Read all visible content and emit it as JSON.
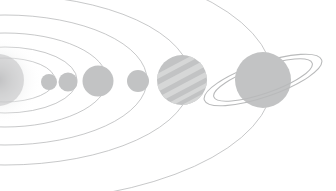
{
  "scene": {
    "title": "Solar System Orbit Diagram",
    "width": 336,
    "height": 191,
    "background_color": "#ffffff",
    "orbit_stroke_color": "#b9babb",
    "orbit_stroke_width": 0.8,
    "planet_fill_color": "#c2c3c4",
    "planet_band_color": "#d6d7d7",
    "ring_stroke_color": "#b9babb",
    "sun_glow_color": "#e9eaea",
    "sun_core_color": "#bfc0c1",
    "focus_x": 5,
    "focus_y": 80
  },
  "sun": {
    "name": "sun",
    "label": "Sun",
    "cx": -2,
    "cy": 80,
    "r": 26,
    "glow_r": 44,
    "clipped": true
  },
  "orbits": [
    {
      "name": "orbit-mercury",
      "label": "Mercury orbit",
      "cx": 5,
      "cy": 80,
      "rx": 50,
      "ry": 22
    },
    {
      "name": "orbit-venus",
      "label": "Venus orbit",
      "cx": 5,
      "cy": 80,
      "rx": 72,
      "ry": 33
    },
    {
      "name": "orbit-earth",
      "label": "Earth orbit",
      "cx": 5,
      "cy": 80,
      "rx": 102,
      "ry": 47
    },
    {
      "name": "orbit-mars",
      "label": "Mars orbit",
      "cx": 5,
      "cy": 80,
      "rx": 142,
      "ry": 65
    },
    {
      "name": "orbit-jupiter",
      "label": "Jupiter orbit",
      "cx": 5,
      "cy": 80,
      "rx": 186,
      "ry": 85
    },
    {
      "name": "orbit-saturn",
      "label": "Saturn orbit",
      "cx": 5,
      "cy": 80,
      "rx": 268,
      "ry": 122
    }
  ],
  "planets": [
    {
      "name": "planet-mercury",
      "label": "Mercury",
      "cx": 49,
      "cy": 82,
      "r": 8,
      "style": "plain",
      "order": 1
    },
    {
      "name": "planet-venus",
      "label": "Venus",
      "cx": 68,
      "cy": 82,
      "r": 9.5,
      "style": "plain",
      "order": 2
    },
    {
      "name": "planet-earth",
      "label": "Earth",
      "cx": 98,
      "cy": 81,
      "r": 15.5,
      "style": "plain",
      "order": 3
    },
    {
      "name": "planet-mars",
      "label": "Mars",
      "cx": 138,
      "cy": 81,
      "r": 11,
      "style": "plain",
      "order": 4
    },
    {
      "name": "planet-jupiter",
      "label": "Jupiter",
      "cx": 182,
      "cy": 80,
      "r": 25,
      "style": "banded",
      "order": 5
    },
    {
      "name": "planet-saturn",
      "label": "Saturn",
      "cx": 263,
      "cy": 80,
      "r": 28,
      "style": "ringed",
      "order": 6
    }
  ],
  "saturn_ring": {
    "name": "saturn-ring",
    "label": "Saturn ring",
    "cx": 263,
    "cy": 80,
    "rx_outer": 62,
    "ry_outer": 17,
    "rx_inner": 52,
    "ry_inner": 13.5,
    "rotation_deg": -19
  },
  "jupiter_bands": [
    {
      "name": "jupiter-band-1",
      "offset": -17,
      "thickness": 4.5
    },
    {
      "name": "jupiter-band-2",
      "offset": -7,
      "thickness": 6.0
    },
    {
      "name": "jupiter-band-3",
      "offset": 4,
      "thickness": 5.0
    },
    {
      "name": "jupiter-band-4",
      "offset": 14,
      "thickness": 4.0
    },
    {
      "name": "jupiter-band-5",
      "offset": 22,
      "thickness": 3.0
    }
  ]
}
